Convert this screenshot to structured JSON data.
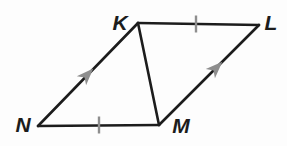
{
  "diagram": {
    "background": "#fdfdfd",
    "stroke_color": "#1c1c1c",
    "mark_color": "#8e8e8e",
    "stroke_width": 2.6,
    "tick_width": 2.4,
    "tick_length": 17,
    "vertices": {
      "K": {
        "label": "K",
        "x": 138,
        "y": 23,
        "label_x": 120,
        "label_y": 22
      },
      "L": {
        "label": "L",
        "x": 259,
        "y": 25,
        "label_x": 271,
        "label_y": 22
      },
      "M": {
        "label": "M",
        "x": 159,
        "y": 125,
        "label_x": 181,
        "label_y": 125
      },
      "N": {
        "label": "N",
        "x": 38,
        "y": 126,
        "label_x": 23,
        "label_y": 124
      }
    },
    "edges": [
      {
        "name": "edge-KL",
        "from": "K",
        "to": "L"
      },
      {
        "name": "edge-LM",
        "from": "L",
        "to": "M"
      },
      {
        "name": "edge-NM",
        "from": "N",
        "to": "M"
      },
      {
        "name": "edge-NK",
        "from": "N",
        "to": "K"
      },
      {
        "name": "diagonal-KM",
        "from": "K",
        "to": "M"
      }
    ],
    "tick_marks": [
      {
        "edge": "KL",
        "x": 196,
        "y": 24
      },
      {
        "edge": "NM",
        "x": 99,
        "y": 125
      }
    ],
    "arrow_marks": [
      {
        "edge": "NK",
        "x": 87,
        "y": 75,
        "angle": -45.8
      },
      {
        "edge": "ML",
        "x": 216,
        "y": 68,
        "angle": -45.0
      }
    ]
  }
}
